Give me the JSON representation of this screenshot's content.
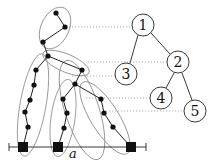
{
  "figure": {
    "axis_label": "a",
    "tree": {
      "nodes": [
        {
          "id": "1",
          "label": "1",
          "x": 143,
          "y": 25
        },
        {
          "id": "2",
          "label": "2",
          "x": 178,
          "y": 62
        },
        {
          "id": "3",
          "label": "3",
          "x": 126,
          "y": 74
        },
        {
          "id": "4",
          "label": "4",
          "x": 161,
          "y": 98
        },
        {
          "id": "5",
          "label": "5",
          "x": 195,
          "y": 111
        }
      ],
      "edges": [
        [
          "1",
          "3"
        ],
        [
          "1",
          "2"
        ],
        [
          "2",
          "4"
        ],
        [
          "2",
          "5"
        ]
      ]
    },
    "chains": [
      {
        "name": "top",
        "points": [
          [
            56,
            13
          ],
          [
            65,
            27
          ],
          [
            43,
            42
          ]
        ]
      },
      {
        "name": "upper-mid",
        "points": [
          [
            48,
            56
          ],
          [
            82,
            70
          ]
        ]
      },
      {
        "name": "left",
        "points": [
          [
            36,
            70
          ],
          [
            34,
            85
          ],
          [
            30,
            100
          ],
          [
            25,
            112
          ],
          [
            28,
            127
          ],
          [
            23,
            147
          ]
        ]
      },
      {
        "name": "mid-left",
        "points": [
          [
            63,
            99
          ],
          [
            67,
            113
          ],
          [
            64,
            128
          ],
          [
            58,
            147
          ]
        ]
      },
      {
        "name": "mid-right",
        "points": [
          [
            101,
            99
          ],
          [
            104,
            113
          ],
          [
            113,
            127
          ],
          [
            131,
            147
          ]
        ]
      }
    ],
    "square_markers": [
      [
        23,
        147
      ],
      [
        58,
        147
      ],
      [
        131,
        147
      ]
    ]
  },
  "colors": {
    "ink": "#111111",
    "ellipse": "#888888",
    "dotted": "#999999"
  }
}
